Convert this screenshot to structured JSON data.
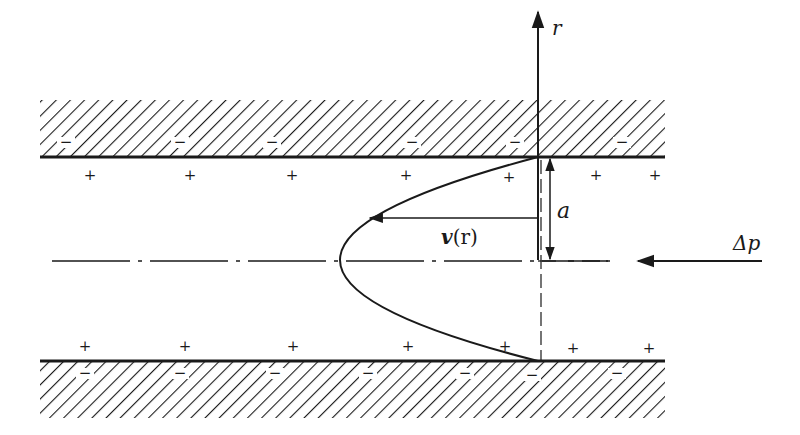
{
  "diagram": {
    "labels": {
      "r_axis": "r",
      "velocity": "v(r)",
      "velocity_symbol": "v",
      "velocity_arg": "(r)",
      "radius": "a",
      "pressure": "Δp"
    },
    "wall_charge_sign": "−",
    "fluid_charge_sign": "+",
    "top_wall_minus_x": [
      66,
      180,
      272,
      412,
      517,
      622
    ],
    "top_plus_x": [
      90,
      190,
      292,
      412,
      510,
      597,
      655
    ],
    "bottom_plus_x": [
      85,
      185,
      293,
      408,
      510,
      573,
      651
    ],
    "bottom_wall_minus_x": [
      85,
      180,
      275,
      368,
      465,
      532,
      617
    ],
    "colors": {
      "ink": "#1a1a1a",
      "background": "#ffffff"
    }
  }
}
